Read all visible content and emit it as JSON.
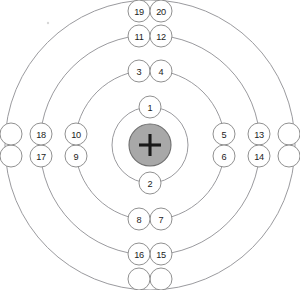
{
  "diagram": {
    "center": {
      "x": 150,
      "y": 145
    },
    "nucleus": {
      "label": "+",
      "radius": 21,
      "fill_color": "#a8a8a8",
      "stroke_color": "#6e6e6e",
      "plus_color": "#1a1a1a",
      "plus_arm": 11
    },
    "style": {
      "background_color": "#ffffff",
      "shell_stroke_color": "#8e8e93",
      "electron_fill_color": "#ffffff",
      "electron_stroke_color": "#8a8a8a",
      "label_color": "#1c1c1c",
      "electron_radius": 11
    },
    "artifacts": [
      {
        "name": "scan-speck",
        "x": 48,
        "y": 23,
        "r": 1.2
      }
    ],
    "shells": [
      {
        "index": 1,
        "name": "shell-1",
        "radius": 38,
        "electron_count": 2,
        "electrons": [
          {
            "label": "1",
            "angle": -90,
            "x": 150,
            "y": 107
          },
          {
            "label": "2",
            "angle": 90,
            "x": 150,
            "y": 183
          }
        ]
      },
      {
        "index": 2,
        "name": "shell-2",
        "radius": 75,
        "electron_count": 8,
        "electrons": [
          {
            "label": "3",
            "angle": -98,
            "x": 139,
            "y": 71
          },
          {
            "label": "4",
            "angle": -82,
            "x": 161,
            "y": 71
          },
          {
            "label": "5",
            "angle": -8,
            "x": 224,
            "y": 134
          },
          {
            "label": "6",
            "angle": 8,
            "x": 224,
            "y": 156
          },
          {
            "label": "7",
            "angle": 82,
            "x": 161,
            "y": 219
          },
          {
            "label": "8",
            "angle": 98,
            "x": 139,
            "y": 219
          },
          {
            "label": "9",
            "angle": 172,
            "x": 76,
            "y": 156
          },
          {
            "label": "10",
            "angle": 188,
            "x": 76,
            "y": 134
          }
        ]
      },
      {
        "index": 3,
        "name": "shell-3",
        "radius": 110,
        "electron_count": 8,
        "electrons": [
          {
            "label": "11",
            "angle": -96,
            "x": 139,
            "y": 36
          },
          {
            "label": "12",
            "angle": -84,
            "x": 161,
            "y": 36
          },
          {
            "label": "13",
            "angle": -6,
            "x": 259,
            "y": 134
          },
          {
            "label": "14",
            "angle": 6,
            "x": 259,
            "y": 156
          },
          {
            "label": "15",
            "angle": 84,
            "x": 161,
            "y": 254
          },
          {
            "label": "16",
            "angle": 96,
            "x": 139,
            "y": 254
          },
          {
            "label": "17",
            "angle": 174,
            "x": 41,
            "y": 156
          },
          {
            "label": "18",
            "angle": 186,
            "x": 41,
            "y": 134
          }
        ]
      },
      {
        "index": 4,
        "name": "shell-4",
        "radius": 145,
        "electron_count": 8,
        "electrons": [
          {
            "label": "19",
            "angle": -94,
            "x": 139,
            "y": 11
          },
          {
            "label": "20",
            "angle": -86,
            "x": 161,
            "y": 11
          },
          {
            "label": "",
            "angle": -5,
            "x": 289,
            "y": 134
          },
          {
            "label": "",
            "angle": 5,
            "x": 289,
            "y": 156
          },
          {
            "label": "",
            "angle": 86,
            "x": 161,
            "y": 279
          },
          {
            "label": "",
            "angle": 94,
            "x": 139,
            "y": 279
          },
          {
            "label": "",
            "angle": 175,
            "x": 11,
            "y": 156
          },
          {
            "label": "",
            "angle": 185,
            "x": 11,
            "y": 134
          }
        ]
      }
    ]
  }
}
